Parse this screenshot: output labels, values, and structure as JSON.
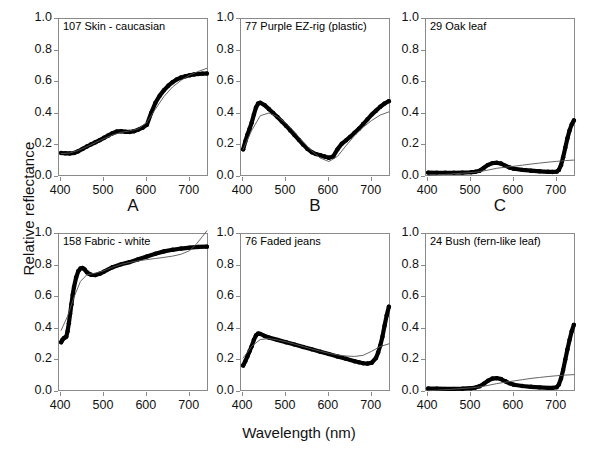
{
  "figure": {
    "xlabel": "Wavelength (nm)",
    "ylabel": "Relative reflectance",
    "panel_letters": [
      "A",
      "B",
      "C"
    ],
    "yticks": [
      "0.0",
      "0.2",
      "0.4",
      "0.6",
      "0.8",
      "1.0"
    ],
    "xticks": [
      "400",
      "500",
      "600",
      "700"
    ],
    "colors": {
      "data_curve": "#000000",
      "fit_curve": "#555555",
      "axis": "#8a8a8a",
      "text": "#111111",
      "background": "#ffffff"
    }
  },
  "chart_data": [
    {
      "type": "line",
      "title": "107 Skin - caucasian",
      "panel": "A",
      "xlabel": "Wavelength (nm)",
      "ylabel": "Relative reflectance",
      "xlim": [
        395,
        745
      ],
      "ylim": [
        0.0,
        1.0
      ],
      "xticks": [
        400,
        500,
        600,
        700
      ],
      "yticks": [
        0.0,
        0.2,
        0.4,
        0.6,
        0.8,
        1.0
      ],
      "grid": false,
      "legend": false,
      "series": [
        {
          "name": "measured reflectance",
          "style": "thick-dotted",
          "x": [
            400,
            410,
            420,
            430,
            440,
            450,
            460,
            470,
            480,
            490,
            500,
            510,
            520,
            530,
            540,
            550,
            560,
            570,
            580,
            590,
            600,
            610,
            620,
            630,
            640,
            650,
            660,
            670,
            680,
            690,
            700,
            710,
            720,
            730,
            740
          ],
          "y": [
            0.152,
            0.15,
            0.149,
            0.152,
            0.163,
            0.178,
            0.193,
            0.207,
            0.22,
            0.233,
            0.248,
            0.263,
            0.277,
            0.288,
            0.29,
            0.286,
            0.285,
            0.29,
            0.3,
            0.312,
            0.33,
            0.405,
            0.47,
            0.515,
            0.55,
            0.578,
            0.6,
            0.618,
            0.63,
            0.638,
            0.644,
            0.649,
            0.652,
            0.654,
            0.655
          ]
        },
        {
          "name": "fitted model",
          "style": "thin-line",
          "x": [
            400,
            420,
            440,
            460,
            480,
            500,
            520,
            540,
            560,
            580,
            600,
            620,
            640,
            660,
            680,
            700,
            720,
            740
          ],
          "y": [
            0.148,
            0.152,
            0.168,
            0.192,
            0.218,
            0.243,
            0.266,
            0.282,
            0.292,
            0.305,
            0.345,
            0.43,
            0.51,
            0.57,
            0.612,
            0.645,
            0.668,
            0.688
          ]
        }
      ]
    },
    {
      "type": "line",
      "title": "77 Purple EZ-rig (plastic)",
      "panel": "B",
      "xlabel": "Wavelength (nm)",
      "ylabel": "Relative reflectance",
      "xlim": [
        395,
        745
      ],
      "ylim": [
        0.0,
        1.0
      ],
      "xticks": [
        400,
        500,
        600,
        700
      ],
      "yticks": [
        0.0,
        0.2,
        0.4,
        0.6,
        0.8,
        1.0
      ],
      "grid": false,
      "legend": false,
      "series": [
        {
          "name": "measured reflectance",
          "style": "thick-dotted",
          "x": [
            400,
            405,
            410,
            415,
            420,
            425,
            430,
            435,
            440,
            450,
            460,
            470,
            480,
            490,
            500,
            510,
            520,
            530,
            540,
            550,
            560,
            570,
            580,
            590,
            600,
            610,
            620,
            630,
            640,
            650,
            660,
            670,
            680,
            690,
            700,
            710,
            720,
            730,
            740
          ],
          "y": [
            0.175,
            0.225,
            0.268,
            0.305,
            0.345,
            0.395,
            0.44,
            0.465,
            0.47,
            0.455,
            0.43,
            0.405,
            0.38,
            0.352,
            0.325,
            0.295,
            0.265,
            0.235,
            0.205,
            0.178,
            0.157,
            0.145,
            0.138,
            0.13,
            0.122,
            0.13,
            0.175,
            0.21,
            0.232,
            0.255,
            0.28,
            0.305,
            0.335,
            0.365,
            0.395,
            0.42,
            0.445,
            0.465,
            0.48
          ]
        },
        {
          "name": "fitted model",
          "style": "thin-line",
          "x": [
            400,
            420,
            440,
            460,
            480,
            500,
            520,
            540,
            560,
            580,
            600,
            620,
            640,
            660,
            680,
            700,
            720,
            740
          ],
          "y": [
            0.175,
            0.295,
            0.388,
            0.405,
            0.382,
            0.34,
            0.285,
            0.222,
            0.165,
            0.12,
            0.098,
            0.13,
            0.198,
            0.262,
            0.315,
            0.358,
            0.392,
            0.412
          ]
        }
      ]
    },
    {
      "type": "line",
      "title": "29 Oak leaf",
      "panel": "C",
      "xlabel": "Wavelength (nm)",
      "ylabel": "Relative reflectance",
      "xlim": [
        395,
        745
      ],
      "ylim": [
        0.0,
        1.0
      ],
      "xticks": [
        400,
        500,
        600,
        700
      ],
      "yticks": [
        0.0,
        0.2,
        0.4,
        0.6,
        0.8,
        1.0
      ],
      "grid": false,
      "legend": false,
      "series": [
        {
          "name": "measured reflectance",
          "style": "thick-dotted",
          "x": [
            400,
            420,
            440,
            460,
            480,
            500,
            510,
            520,
            530,
            540,
            550,
            560,
            570,
            580,
            590,
            600,
            620,
            640,
            660,
            680,
            690,
            700,
            705,
            710,
            715,
            720,
            725,
            730,
            735,
            740
          ],
          "y": [
            0.028,
            0.027,
            0.027,
            0.027,
            0.028,
            0.03,
            0.033,
            0.04,
            0.058,
            0.077,
            0.088,
            0.09,
            0.085,
            0.072,
            0.06,
            0.052,
            0.045,
            0.04,
            0.036,
            0.033,
            0.032,
            0.034,
            0.045,
            0.075,
            0.125,
            0.185,
            0.245,
            0.295,
            0.333,
            0.358
          ]
        },
        {
          "name": "fitted model",
          "style": "thin-line",
          "x": [
            400,
            450,
            500,
            520,
            540,
            560,
            580,
            600,
            620,
            640,
            660,
            680,
            700,
            720,
            740
          ],
          "y": [
            0.01,
            0.018,
            0.028,
            0.034,
            0.044,
            0.055,
            0.062,
            0.068,
            0.075,
            0.082,
            0.088,
            0.094,
            0.099,
            0.104,
            0.107
          ]
        }
      ]
    },
    {
      "type": "line",
      "title": "158 Fabric - white",
      "panel": "D",
      "xlabel": "Wavelength (nm)",
      "ylabel": "Relative reflectance",
      "xlim": [
        395,
        745
      ],
      "ylim": [
        0.0,
        1.0
      ],
      "xticks": [
        400,
        500,
        600,
        700
      ],
      "yticks": [
        0.0,
        0.2,
        0.4,
        0.6,
        0.8,
        1.0
      ],
      "grid": false,
      "legend": false,
      "series": [
        {
          "name": "measured reflectance",
          "style": "thick-dotted",
          "x": [
            400,
            403,
            406,
            409,
            412,
            415,
            418,
            421,
            424,
            427,
            430,
            435,
            440,
            445,
            450,
            455,
            460,
            465,
            470,
            480,
            490,
            500,
            520,
            540,
            560,
            580,
            600,
            620,
            640,
            660,
            680,
            700,
            720,
            740
          ],
          "y": [
            0.315,
            0.33,
            0.34,
            0.345,
            0.35,
            0.385,
            0.435,
            0.495,
            0.555,
            0.615,
            0.665,
            0.725,
            0.765,
            0.782,
            0.785,
            0.775,
            0.758,
            0.748,
            0.742,
            0.74,
            0.748,
            0.762,
            0.79,
            0.808,
            0.822,
            0.84,
            0.858,
            0.875,
            0.89,
            0.9,
            0.908,
            0.914,
            0.918,
            0.92
          ]
        },
        {
          "name": "fitted model",
          "style": "thin-line",
          "x": [
            400,
            415,
            430,
            445,
            460,
            480,
            500,
            520,
            540,
            560,
            580,
            600,
            620,
            640,
            660,
            680,
            700,
            715,
            730,
            740
          ],
          "y": [
            0.39,
            0.48,
            0.6,
            0.7,
            0.742,
            0.752,
            0.768,
            0.79,
            0.808,
            0.82,
            0.83,
            0.838,
            0.845,
            0.852,
            0.86,
            0.872,
            0.895,
            0.935,
            0.985,
            1.02
          ]
        }
      ]
    },
    {
      "type": "line",
      "title": "76 Faded jeans",
      "panel": "E",
      "xlabel": "Wavelength (nm)",
      "ylabel": "Relative reflectance",
      "xlim": [
        395,
        745
      ],
      "ylim": [
        0.0,
        1.0
      ],
      "xticks": [
        400,
        500,
        600,
        700
      ],
      "yticks": [
        0.0,
        0.2,
        0.4,
        0.6,
        0.8,
        1.0
      ],
      "grid": false,
      "legend": false,
      "series": [
        {
          "name": "measured reflectance",
          "style": "thick-dotted",
          "x": [
            400,
            405,
            410,
            415,
            420,
            425,
            430,
            435,
            440,
            450,
            460,
            480,
            500,
            520,
            540,
            560,
            580,
            600,
            620,
            640,
            660,
            670,
            680,
            690,
            700,
            710,
            715,
            720,
            725,
            730,
            735,
            740
          ],
          "y": [
            0.168,
            0.195,
            0.225,
            0.258,
            0.29,
            0.33,
            0.358,
            0.37,
            0.368,
            0.355,
            0.345,
            0.33,
            0.315,
            0.3,
            0.285,
            0.27,
            0.255,
            0.24,
            0.225,
            0.21,
            0.195,
            0.188,
            0.182,
            0.18,
            0.185,
            0.215,
            0.25,
            0.295,
            0.35,
            0.42,
            0.485,
            0.54
          ]
        },
        {
          "name": "fitted model",
          "style": "thin-line",
          "x": [
            400,
            420,
            440,
            460,
            480,
            500,
            520,
            540,
            560,
            580,
            600,
            620,
            640,
            660,
            680,
            700,
            720,
            740
          ],
          "y": [
            0.215,
            0.29,
            0.332,
            0.338,
            0.33,
            0.318,
            0.303,
            0.288,
            0.272,
            0.258,
            0.245,
            0.235,
            0.228,
            0.225,
            0.232,
            0.258,
            0.288,
            0.305
          ]
        }
      ]
    },
    {
      "type": "line",
      "title": "24 Bush (fern-like leaf)",
      "panel": "F",
      "xlabel": "Wavelength (nm)",
      "ylabel": "Relative reflectance",
      "xlim": [
        395,
        745
      ],
      "ylim": [
        0.0,
        1.0
      ],
      "xticks": [
        400,
        500,
        600,
        700
      ],
      "yticks": [
        0.0,
        0.2,
        0.4,
        0.6,
        0.8,
        1.0
      ],
      "grid": false,
      "legend": false,
      "series": [
        {
          "name": "measured reflectance",
          "style": "thick-dotted",
          "x": [
            400,
            420,
            440,
            460,
            480,
            500,
            510,
            520,
            530,
            540,
            550,
            560,
            570,
            580,
            590,
            600,
            620,
            640,
            660,
            680,
            690,
            700,
            705,
            710,
            715,
            720,
            725,
            730,
            735,
            740
          ],
          "y": [
            0.022,
            0.021,
            0.02,
            0.02,
            0.021,
            0.024,
            0.028,
            0.036,
            0.052,
            0.072,
            0.085,
            0.088,
            0.082,
            0.068,
            0.055,
            0.046,
            0.038,
            0.033,
            0.029,
            0.026,
            0.026,
            0.03,
            0.048,
            0.085,
            0.14,
            0.205,
            0.27,
            0.33,
            0.385,
            0.425
          ]
        },
        {
          "name": "fitted model",
          "style": "thin-line",
          "x": [
            400,
            450,
            500,
            520,
            540,
            560,
            580,
            600,
            620,
            640,
            660,
            680,
            700,
            720,
            740
          ],
          "y": [
            0.008,
            0.016,
            0.026,
            0.032,
            0.042,
            0.053,
            0.062,
            0.07,
            0.078,
            0.086,
            0.092,
            0.098,
            0.103,
            0.107,
            0.11
          ]
        }
      ]
    }
  ]
}
